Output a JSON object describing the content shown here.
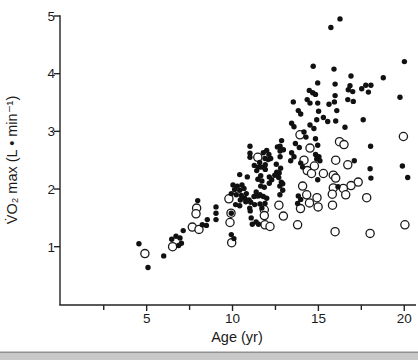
{
  "chart_data": {
    "type": "scatter",
    "title": "",
    "xlabel": "Age (yr)",
    "ylabel": "V̇O₂ max  (L • min⁻¹)",
    "xlim": [
      0,
      20.7
    ],
    "ylim": [
      0,
      5
    ],
    "x_major_ticks": [
      5,
      10,
      15,
      20
    ],
    "x_minor_ticks": [
      2.5,
      7.5,
      12.5,
      17.5
    ],
    "y_ticks": [
      1,
      2,
      3,
      4,
      5
    ],
    "grid": false,
    "legend": "none",
    "marker_colors": {
      "filled": "#111111",
      "open_stroke": "#1a1a1a",
      "open_fill": "#ffffff"
    },
    "series": [
      {
        "name": "filled-circles",
        "marker": "filled-circle",
        "points": [
          [
            4.55,
            1.05
          ],
          [
            5.08,
            0.64
          ],
          [
            5.99,
            0.84
          ],
          [
            6.46,
            1.13
          ],
          [
            6.71,
            1.18
          ],
          [
            6.94,
            1.15
          ],
          [
            7.02,
            1.06
          ],
          [
            6.86,
            1.02
          ],
          [
            7.13,
            1.28
          ],
          [
            7.97,
            1.8
          ],
          [
            8.24,
            1.38
          ],
          [
            8.53,
            1.47
          ],
          [
            8.48,
            1.37
          ],
          [
            9.04,
            1.69
          ],
          [
            9.04,
            1.58
          ],
          [
            9.04,
            1.47
          ],
          [
            10.03,
            2.07
          ],
          [
            10.28,
            2.05
          ],
          [
            10.55,
            2.07
          ],
          [
            10.12,
            1.99
          ],
          [
            10.42,
            1.98
          ],
          [
            10.67,
            2.01
          ],
          [
            9.93,
            1.92
          ],
          [
            10.22,
            1.9
          ],
          [
            10.51,
            1.89
          ],
          [
            10.8,
            1.92
          ],
          [
            10.71,
            1.84
          ],
          [
            10.45,
            1.81
          ],
          [
            10.96,
            1.81
          ],
          [
            10.77,
            1.78
          ],
          [
            10.18,
            1.73
          ],
          [
            10.42,
            1.71
          ],
          [
            9.93,
            1.58
          ],
          [
            9.93,
            1.21
          ],
          [
            10.08,
            1.14
          ],
          [
            10.42,
            2.25
          ],
          [
            10.86,
            2.21
          ],
          [
            11.58,
            2.46
          ],
          [
            11.91,
            2.42
          ],
          [
            11.64,
            2.38
          ],
          [
            11.91,
            2.34
          ],
          [
            12.55,
            2.43
          ],
          [
            12.8,
            2.36
          ],
          [
            11.64,
            2.23
          ],
          [
            11.48,
            2.17
          ],
          [
            11.71,
            2.14
          ],
          [
            12.69,
            2.2
          ],
          [
            12.84,
            2.12
          ],
          [
            12.75,
            2.05
          ],
          [
            11.38,
            1.95
          ],
          [
            11.52,
            1.88
          ],
          [
            12.22,
            2.53
          ],
          [
            11.79,
            2.38
          ],
          [
            12.14,
            2.21
          ],
          [
            12.28,
            2.16
          ],
          [
            12.14,
            2.1
          ],
          [
            12.57,
            2.29
          ],
          [
            12.72,
            2.28
          ],
          [
            12.46,
            2.24
          ],
          [
            11.64,
            2.05
          ],
          [
            11.85,
            2.03
          ],
          [
            12.92,
            2.09
          ],
          [
            12.92,
            1.98
          ],
          [
            12.61,
            2.73
          ],
          [
            12.86,
            2.84
          ],
          [
            11.02,
            2.74
          ],
          [
            11.02,
            2.62
          ],
          [
            11.02,
            2.55
          ],
          [
            11.99,
            2.67
          ],
          [
            11.79,
            2.63
          ],
          [
            12.12,
            2.6
          ],
          [
            11.89,
            2.53
          ],
          [
            12.08,
            2.51
          ],
          [
            11.27,
            2.41
          ],
          [
            11.5,
            2.38
          ],
          [
            11.41,
            2.32
          ],
          [
            12.77,
            2.74
          ],
          [
            12.77,
            2.66
          ],
          [
            12.96,
            2.68
          ],
          [
            12.77,
            2.56
          ],
          [
            11.25,
            1.87
          ],
          [
            11.06,
            1.77
          ],
          [
            11.29,
            1.73
          ],
          [
            11.0,
            1.67
          ],
          [
            11.41,
            1.88
          ],
          [
            11.6,
            1.9
          ],
          [
            11.79,
            1.87
          ],
          [
            11.99,
            1.84
          ],
          [
            12.76,
            1.9
          ],
          [
            13.83,
            1.88
          ],
          [
            11.6,
            1.74
          ],
          [
            11.89,
            1.75
          ],
          [
            11.71,
            1.67
          ],
          [
            11.37,
            1.43
          ],
          [
            11.51,
            1.39
          ],
          [
            11.03,
            1.62
          ],
          [
            11.09,
            1.5
          ],
          [
            11.15,
            1.39
          ],
          [
            13.97,
            1.82
          ],
          [
            13.79,
            1.75
          ],
          [
            14.28,
            2.9
          ],
          [
            13.66,
            2.79
          ],
          [
            13.89,
            2.72
          ],
          [
            13.44,
            2.63
          ],
          [
            13.58,
            2.56
          ],
          [
            13.39,
            2.49
          ],
          [
            13.97,
            2.45
          ],
          [
            14.08,
            2.38
          ],
          [
            14.7,
            4.13
          ],
          [
            14.96,
            3.84
          ],
          [
            14.47,
            3.71
          ],
          [
            14.67,
            3.67
          ],
          [
            13.54,
            3.51
          ],
          [
            14.35,
            3.55
          ],
          [
            14.51,
            3.49
          ],
          [
            13.83,
            3.36
          ],
          [
            13.97,
            3.3
          ],
          [
            13.44,
            3.14
          ],
          [
            13.58,
            3.08
          ],
          [
            14.51,
            3.11
          ],
          [
            14.74,
            3.05
          ],
          [
            14.16,
            2.99
          ],
          [
            14.83,
            3.64
          ],
          [
            14.96,
            3.49
          ],
          [
            15.01,
            3.35
          ],
          [
            14.9,
            3.2
          ],
          [
            14.83,
            2.87
          ],
          [
            15.97,
            3.62
          ],
          [
            16.74,
            3.72
          ],
          [
            17.0,
            3.69
          ],
          [
            17.52,
            3.74
          ],
          [
            17.91,
            3.68
          ],
          [
            15.62,
            3.47
          ],
          [
            15.93,
            3.51
          ],
          [
            16.71,
            3.55
          ],
          [
            17.03,
            3.52
          ],
          [
            16.07,
            3.36
          ],
          [
            15.29,
            3.24
          ],
          [
            15.54,
            3.17
          ],
          [
            16.01,
            3.18
          ],
          [
            17.61,
            3.2
          ],
          [
            16.55,
            3.07
          ],
          [
            19.75,
            3.59
          ],
          [
            14.96,
            2.76
          ],
          [
            14.84,
            2.6
          ],
          [
            15.03,
            2.56
          ],
          [
            14.9,
            2.52
          ],
          [
            15.09,
            2.49
          ],
          [
            18.04,
            2.74
          ],
          [
            17.09,
            2.49
          ],
          [
            19.89,
            2.4
          ],
          [
            18.01,
            2.35
          ],
          [
            20.2,
            2.2
          ],
          [
            18.06,
            2.19
          ],
          [
            16.14,
            2.04
          ],
          [
            14.96,
            2.16
          ],
          [
            16.26,
            4.95
          ],
          [
            15.73,
            4.8
          ],
          [
            20.01,
            4.21
          ],
          [
            15.91,
            4.08
          ],
          [
            16.9,
            3.96
          ],
          [
            15.97,
            3.82
          ],
          [
            16.84,
            3.79
          ],
          [
            17.76,
            3.8
          ],
          [
            18.06,
            3.8
          ],
          [
            18.78,
            3.93
          ]
        ]
      },
      {
        "name": "open-circles",
        "marker": "open-circle",
        "points": [
          [
            4.9,
            0.88
          ],
          [
            6.51,
            1.0
          ],
          [
            7.91,
            1.67
          ],
          [
            7.87,
            1.57
          ],
          [
            7.66,
            1.34
          ],
          [
            8.05,
            1.3
          ],
          [
            9.79,
            1.83
          ],
          [
            9.91,
            1.58
          ],
          [
            9.85,
            1.42
          ],
          [
            9.95,
            1.07
          ],
          [
            11.47,
            2.55
          ],
          [
            12.7,
            1.72
          ],
          [
            11.85,
            1.64
          ],
          [
            11.85,
            1.54
          ],
          [
            12.96,
            1.53
          ],
          [
            11.89,
            1.38
          ],
          [
            12.18,
            1.35
          ],
          [
            13.79,
            1.38
          ],
          [
            13.96,
            1.66
          ],
          [
            13.93,
            2.94
          ],
          [
            14.51,
            2.71
          ],
          [
            14.16,
            2.5
          ],
          [
            14.35,
            2.32
          ],
          [
            14.6,
            2.27
          ],
          [
            14.77,
            2.4
          ],
          [
            14.08,
            2.05
          ],
          [
            14.32,
            1.9
          ],
          [
            14.48,
            1.76
          ],
          [
            14.92,
            1.85
          ],
          [
            16.01,
            2.5
          ],
          [
            16.71,
            2.42
          ],
          [
            15.29,
            2.27
          ],
          [
            15.87,
            2.24
          ],
          [
            16.01,
            2.19
          ],
          [
            17.32,
            2.12
          ],
          [
            16.9,
            2.06
          ],
          [
            15.87,
            2.02
          ],
          [
            16.45,
            2.01
          ],
          [
            15.81,
            1.91
          ],
          [
            16.59,
            1.9
          ],
          [
            17.81,
            1.85
          ],
          [
            14.98,
            1.69
          ],
          [
            15.82,
            1.72
          ],
          [
            19.95,
            2.91
          ],
          [
            16.23,
            2.82
          ],
          [
            16.49,
            2.77
          ],
          [
            15.97,
            1.26
          ],
          [
            18.01,
            1.23
          ],
          [
            20.04,
            1.38
          ]
        ]
      }
    ]
  },
  "page": {
    "bottom_band": "page-edge"
  }
}
